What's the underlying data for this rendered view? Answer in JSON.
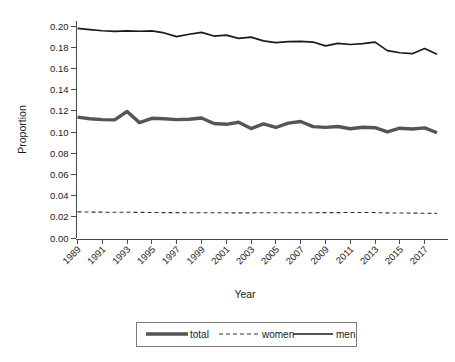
{
  "chart_data": {
    "type": "line",
    "title": "",
    "xlabel": "Year",
    "ylabel": "Proportion",
    "grid": false,
    "legend_position": "bottom",
    "xlim": [
      1989,
      2018
    ],
    "ylim": [
      0.0,
      0.205
    ],
    "x": [
      1989,
      1990,
      1991,
      1992,
      1993,
      1994,
      1995,
      1996,
      1997,
      1998,
      1999,
      2000,
      2001,
      2002,
      2003,
      2004,
      2005,
      2006,
      2007,
      2008,
      2009,
      2010,
      2011,
      2012,
      2013,
      2014,
      2015,
      2016,
      2017,
      2018
    ],
    "x_tick_labels": [
      "1989",
      "1991",
      "1993",
      "1995",
      "1997",
      "1999",
      "2001",
      "2003",
      "2005",
      "2007",
      "2009",
      "2011",
      "2013",
      "2015",
      "2017"
    ],
    "y_tick_labels": [
      "0.00",
      "0.02",
      "0.04",
      "0.06",
      "0.08",
      "0.10",
      "0.12",
      "0.14",
      "0.16",
      "0.18",
      "0.20"
    ],
    "y_ticks": [
      0.0,
      0.02,
      0.04,
      0.06,
      0.08,
      0.1,
      0.12,
      0.14,
      0.16,
      0.18,
      0.2
    ],
    "series": [
      {
        "name": "total",
        "style": "solid-thick",
        "color": "#555555",
        "values": [
          0.1142,
          0.1127,
          0.1118,
          0.1116,
          0.1196,
          0.109,
          0.1131,
          0.1126,
          0.1118,
          0.1122,
          0.1134,
          0.1082,
          0.1074,
          0.1094,
          0.1034,
          0.1078,
          0.1044,
          0.1085,
          0.1101,
          0.1052,
          0.1045,
          0.1053,
          0.1032,
          0.1046,
          0.1042,
          0.1002,
          0.1037,
          0.103,
          0.104,
          0.0994
        ]
      },
      {
        "name": "women",
        "style": "dashed",
        "color": "#333333",
        "values": [
          0.0247,
          0.0245,
          0.0244,
          0.0243,
          0.0243,
          0.0242,
          0.0241,
          0.024,
          0.024,
          0.0239,
          0.0238,
          0.0238,
          0.0238,
          0.0237,
          0.0237,
          0.0239,
          0.0238,
          0.0238,
          0.0239,
          0.0239,
          0.024,
          0.024,
          0.0241,
          0.0241,
          0.024,
          0.0237,
          0.0236,
          0.0235,
          0.0234,
          0.0232
        ]
      },
      {
        "name": "men",
        "style": "solid-thin",
        "color": "#1a1a1a",
        "values": [
          0.198,
          0.1968,
          0.1958,
          0.1952,
          0.1957,
          0.1953,
          0.1956,
          0.1937,
          0.1902,
          0.1925,
          0.1943,
          0.1908,
          0.1916,
          0.1886,
          0.1898,
          0.1862,
          0.1846,
          0.1856,
          0.1858,
          0.1851,
          0.1815,
          0.1839,
          0.1828,
          0.1836,
          0.185,
          0.177,
          0.175,
          0.1741,
          0.179,
          0.1736
        ]
      }
    ]
  },
  "legend": {
    "items": [
      {
        "label": "total"
      },
      {
        "label": "women"
      },
      {
        "label": "men"
      }
    ]
  },
  "axes": {
    "y_title": "Proportion",
    "x_title": "Year"
  }
}
